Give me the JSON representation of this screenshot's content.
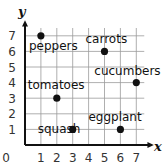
{
  "chart_data": {
    "type": "scatter",
    "title": "",
    "xlabel": "x",
    "ylabel": "y",
    "xlim": [
      0,
      7
    ],
    "ylim": [
      0,
      7
    ],
    "grid": true,
    "x_ticks": [
      "0",
      "1",
      "2",
      "3",
      "4",
      "5",
      "6",
      "7"
    ],
    "y_ticks": [
      "1",
      "2",
      "3",
      "4",
      "5",
      "6",
      "7"
    ],
    "points": [
      {
        "label": "peppers",
        "x": 1,
        "y": 7
      },
      {
        "label": "carrots",
        "x": 5,
        "y": 6
      },
      {
        "label": "cucumbers",
        "x": 7,
        "y": 4
      },
      {
        "label": "tomatoes",
        "x": 2,
        "y": 3
      },
      {
        "label": "squash",
        "x": 3,
        "y": 1
      },
      {
        "label": "eggplant",
        "x": 6,
        "y": 1
      }
    ]
  },
  "colors": {
    "grid": "#9a9a9a",
    "axis": "#111111",
    "point": "#111111"
  }
}
